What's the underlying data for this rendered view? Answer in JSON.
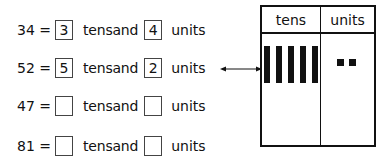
{
  "exercise": {
    "rows": [
      {
        "number": "34 =",
        "tens": "3",
        "tens_label": "tensand",
        "units": "4",
        "units_label": "units"
      },
      {
        "number": "52 =",
        "tens": "5",
        "tens_label": "tensand",
        "units": "2",
        "units_label": "units"
      },
      {
        "number": "47 =",
        "tens": "",
        "tens_label": "tensand",
        "units": "",
        "units_label": "units"
      },
      {
        "number": "81 =",
        "tens": "",
        "tens_label": "tensand",
        "units": "",
        "units_label": "units"
      }
    ]
  },
  "place_value_table": {
    "headers": [
      "tens",
      "units"
    ],
    "tens_bars": 5,
    "unit_cubes": 2
  },
  "icons": {
    "arrow": "double-arrow-icon"
  }
}
